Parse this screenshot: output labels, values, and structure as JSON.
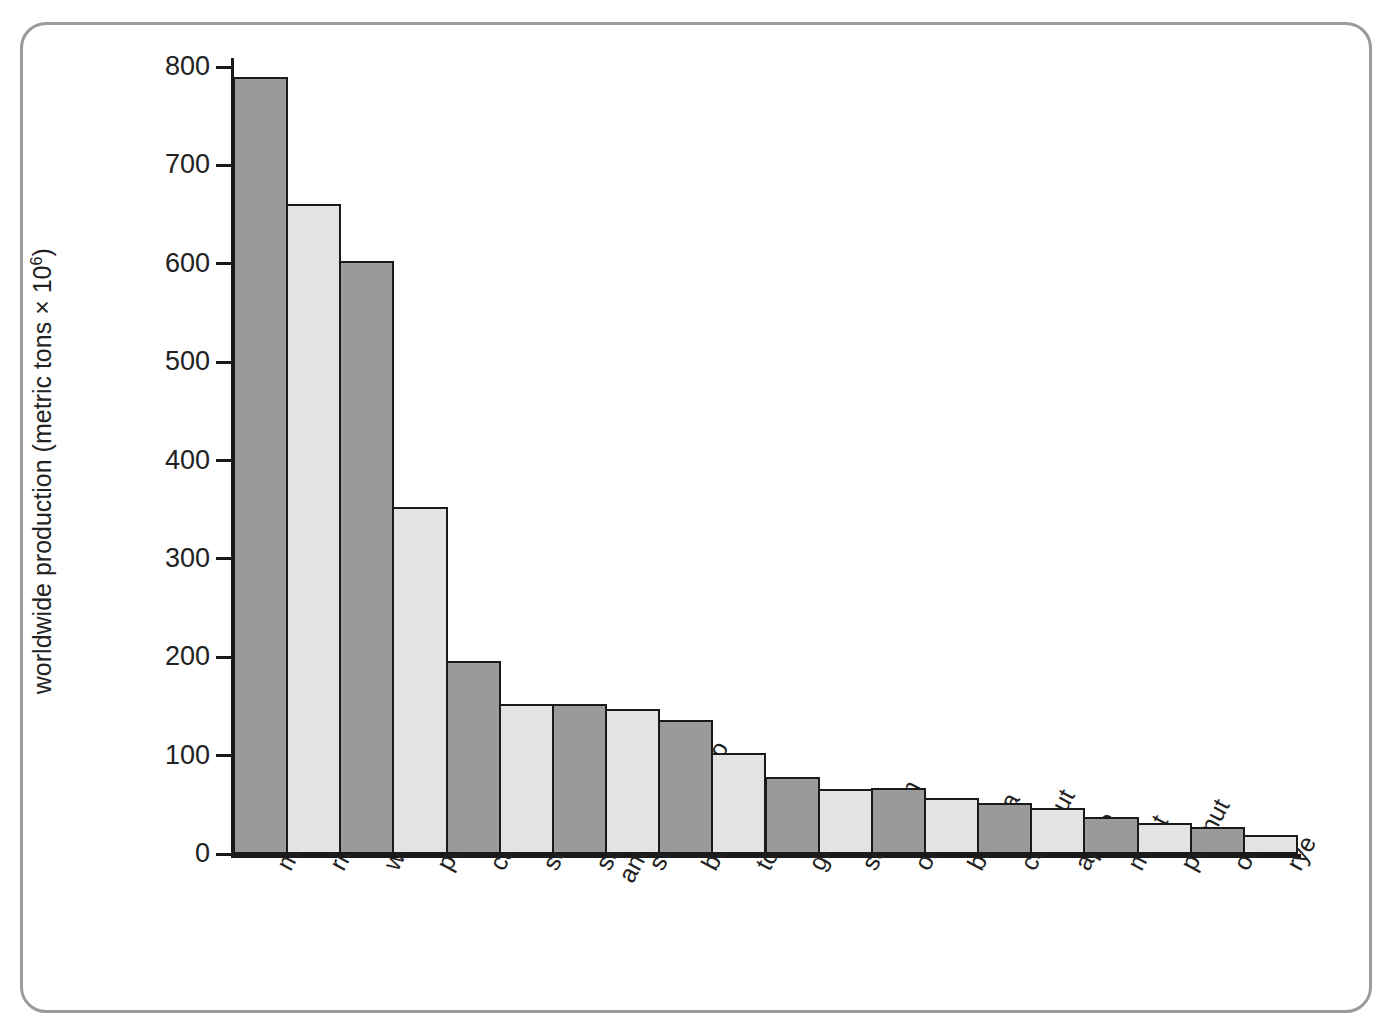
{
  "chart_data": {
    "type": "bar",
    "title": "",
    "xlabel": "",
    "ylabel": "worldwide production (metric tons × 10⁶)",
    "ylabel_text": "worldwide production (metric tons × 10",
    "ylabel_exponent": "6",
    "ylabel_suffix": ")",
    "ylim": [
      0,
      800
    ],
    "ytick_values": [
      0,
      100,
      200,
      300,
      400,
      500,
      600,
      700,
      800
    ],
    "ytick_labels": [
      "0",
      "100",
      "200",
      "300",
      "400",
      "500",
      "600",
      "700",
      "800"
    ],
    "grid": false,
    "legend": null,
    "categories": [
      "maize",
      "rice",
      "wheat",
      "potato",
      "cassava",
      "soya bean",
      "sugar (cane\nand beet)",
      "sweet potato",
      "barley",
      "tomato",
      "grape",
      "sorghum",
      "orange",
      "banana",
      "coconut",
      "apple",
      "millet",
      "peanut",
      "oat",
      "rye"
    ],
    "values": [
      790,
      661,
      603,
      353,
      196,
      152,
      152,
      147,
      136,
      103,
      78,
      66,
      67,
      57,
      52,
      47,
      38,
      32,
      27,
      19
    ],
    "bar_colors": [
      "#9a9a9a",
      "#e3e3e3",
      "#9a9a9a",
      "#e3e3e3",
      "#9a9a9a",
      "#e3e3e3",
      "#9a9a9a",
      "#e3e3e3",
      "#9a9a9a",
      "#e3e3e3",
      "#9a9a9a",
      "#e3e3e3",
      "#9a9a9a",
      "#e3e3e3",
      "#9a9a9a",
      "#e3e3e3",
      "#9a9a9a",
      "#e3e3e3",
      "#9a9a9a",
      "#e3e3e3"
    ],
    "bar_edge_color": "#1a1a1a",
    "axis_color": "#1a1a1a",
    "frame_color": "#9b9b9b",
    "background_color": "#ffffff"
  }
}
